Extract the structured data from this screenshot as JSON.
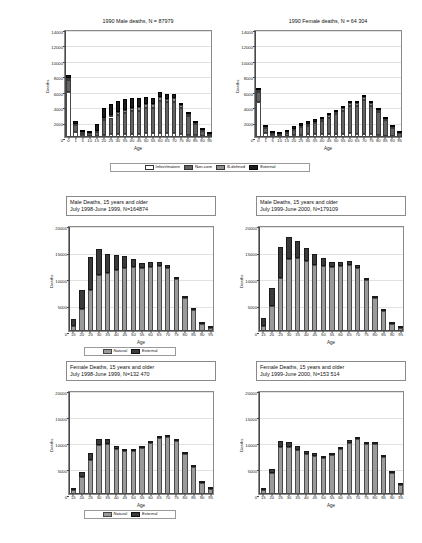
{
  "figure": {
    "background": "#ffffff",
    "axis_color": "#4a4a4a",
    "grid_color": "#e2e2e2"
  },
  "legends": {
    "cause4": {
      "items": [
        {
          "label": "Infect/matern",
          "color": "#ffffff",
          "key": "infect"
        },
        {
          "label": "Non-com",
          "color": "#636363",
          "key": "noncom"
        },
        {
          "label": "Ill-defined",
          "color": "#8f8f8f",
          "key": "illdef"
        },
        {
          "label": "External",
          "color": "#1c1c1c",
          "key": "external"
        }
      ]
    },
    "cause2_a": {
      "items": [
        {
          "label": "Natural",
          "color": "#9a9a9a",
          "key": "natural"
        },
        {
          "label": "External",
          "color": "#3a3a3a",
          "key": "extern2"
        }
      ]
    },
    "cause2_b": {
      "items": [
        {
          "label": "Natural",
          "color": "#9a9a9a",
          "key": "natural"
        },
        {
          "label": "External",
          "color": "#3a3a3a",
          "key": "extern2"
        }
      ]
    }
  },
  "chart_data": [
    {
      "id": "male1990",
      "type": "bar",
      "stacked": true,
      "title": "1990 Male deaths, N = 87979",
      "xlabel": "Age",
      "ylabel": "Deaths",
      "ylim": [
        0,
        14000
      ],
      "yticks": [
        0,
        2000,
        4000,
        6000,
        8000,
        10000,
        12000,
        14000
      ],
      "ytick_labels": [
        "0",
        "2000",
        "4000",
        "6000",
        "8000",
        "10000",
        "12000",
        "14000"
      ],
      "grid": true,
      "categories": [
        "0",
        "1",
        "5",
        "10",
        "15",
        "20",
        "25",
        "30",
        "35",
        "40",
        "45",
        "50",
        "55",
        "60",
        "65",
        "70",
        "75",
        "80",
        "85",
        "90",
        "95"
      ],
      "series": [
        {
          "name": "Infect/matern",
          "key": "infect",
          "values": [
            5900,
            700,
            260,
            180,
            150,
            260,
            330,
            380,
            420,
            420,
            430,
            480,
            500,
            520,
            500,
            480,
            420,
            300,
            200,
            110,
            50
          ]
        },
        {
          "name": "Non-com",
          "key": "noncom",
          "values": [
            1500,
            900,
            280,
            280,
            520,
            1900,
            2200,
            2500,
            2700,
            2900,
            3000,
            3300,
            3300,
            4200,
            4000,
            4100,
            3300,
            2400,
            1500,
            700,
            250
          ]
        },
        {
          "name": "Ill-defined",
          "key": "illdef",
          "values": [
            300,
            120,
            60,
            60,
            120,
            300,
            340,
            370,
            400,
            420,
            430,
            450,
            460,
            480,
            470,
            450,
            380,
            260,
            170,
            80,
            35
          ]
        },
        {
          "name": "External",
          "key": "external",
          "values": [
            400,
            380,
            200,
            280,
            900,
            1300,
            1400,
            1450,
            1450,
            1350,
            1200,
            900,
            800,
            700,
            600,
            500,
            350,
            220,
            140,
            60,
            25
          ]
        }
      ]
    },
    {
      "id": "female1990",
      "type": "bar",
      "stacked": true,
      "title": "1990 Female deaths, N = 64 304",
      "xlabel": "Age",
      "ylabel": "Deaths",
      "ylim": [
        0,
        14000
      ],
      "yticks": [
        0,
        2000,
        4000,
        6000,
        8000,
        10000,
        12000,
        14000
      ],
      "ytick_labels": [
        "0",
        "2000",
        "4000",
        "6000",
        "8000",
        "10000",
        "12000",
        "14000"
      ],
      "grid": true,
      "categories": [
        "0",
        "1",
        "5",
        "10",
        "15",
        "20",
        "25",
        "30",
        "35",
        "40",
        "45",
        "50",
        "55",
        "60",
        "65",
        "70",
        "75",
        "80",
        "85",
        "90",
        "95"
      ],
      "series": [
        {
          "name": "Infect/matern",
          "key": "infect",
          "values": [
            4600,
            520,
            200,
            150,
            160,
            230,
            300,
            340,
            360,
            380,
            400,
            420,
            450,
            470,
            450,
            430,
            360,
            260,
            170,
            90,
            45
          ]
        },
        {
          "name": "Non-com",
          "key": "noncom",
          "values": [
            1200,
            620,
            220,
            210,
            380,
            700,
            950,
            1150,
            1400,
            1700,
            2100,
            2500,
            2900,
            3600,
            3600,
            4400,
            3700,
            3000,
            2000,
            1100,
            480
          ]
        },
        {
          "name": "Ill-defined",
          "key": "illdef",
          "values": [
            260,
            110,
            55,
            50,
            90,
            150,
            190,
            220,
            250,
            280,
            300,
            330,
            360,
            390,
            380,
            380,
            320,
            240,
            160,
            85,
            40
          ]
        },
        {
          "name": "External",
          "key": "external",
          "values": [
            300,
            180,
            120,
            130,
            230,
            330,
            340,
            330,
            310,
            290,
            260,
            230,
            200,
            180,
            160,
            140,
            110,
            80,
            55,
            30,
            15
          ]
        }
      ]
    },
    {
      "id": "male9899",
      "type": "bar",
      "stacked": true,
      "title_lines": [
        "Male Deaths, 15 years and older",
        "July 1998-June 1999, N=164874"
      ],
      "xlabel": "Age",
      "ylabel": "Deaths",
      "ylim": [
        0,
        20000
      ],
      "yticks": [
        0,
        5000,
        10000,
        15000,
        20000
      ],
      "ytick_labels": [
        "0",
        "5000",
        "10000",
        "15000",
        "20000"
      ],
      "grid": true,
      "categories": [
        "15",
        "20",
        "25",
        "30",
        "35",
        "40",
        "45",
        "50",
        "55",
        "60",
        "65",
        "70",
        "75",
        "80",
        "85",
        "90",
        "95"
      ],
      "series": [
        {
          "name": "Natural",
          "key": "natural",
          "values": [
            900,
            4200,
            7700,
            10600,
            11000,
            11500,
            11800,
            12000,
            11800,
            12100,
            12300,
            11900,
            9800,
            6300,
            3900,
            1300,
            500
          ]
        },
        {
          "name": "External",
          "key": "extern2",
          "values": [
            1400,
            3500,
            6300,
            4900,
            3600,
            2800,
            2300,
            1500,
            1000,
            900,
            800,
            600,
            400,
            250,
            150,
            60,
            25
          ]
        }
      ]
    },
    {
      "id": "male9900",
      "type": "bar",
      "stacked": true,
      "title_lines": [
        "Male Deaths, 15 years and older",
        "July 1999-June 2000, N=179109"
      ],
      "xlabel": "Age",
      "ylabel": "Deaths",
      "ylim": [
        0,
        20000
      ],
      "yticks": [
        0,
        5000,
        10000,
        15000,
        20000
      ],
      "ytick_labels": [
        "0",
        "5000",
        "10000",
        "15000",
        "20000"
      ],
      "grid": true,
      "categories": [
        "15",
        "20",
        "25",
        "30",
        "35",
        "40",
        "45",
        "50",
        "55",
        "60",
        "65",
        "70",
        "75",
        "80",
        "85",
        "90",
        "95"
      ],
      "series": [
        {
          "name": "Natural",
          "key": "natural",
          "values": [
            1000,
            4800,
            10000,
            13500,
            13800,
            13200,
            12500,
            12300,
            12000,
            12200,
            12400,
            11800,
            9600,
            6200,
            3800,
            1300,
            500
          ]
        },
        {
          "name": "External",
          "key": "extern2",
          "values": [
            1500,
            3400,
            5800,
            4300,
            3200,
            2500,
            2000,
            1400,
            1000,
            900,
            800,
            600,
            400,
            250,
            150,
            60,
            25
          ]
        }
      ]
    },
    {
      "id": "female9899",
      "type": "bar",
      "stacked": true,
      "title_lines": [
        "Female Deaths, 15 years and older",
        "July 1998-June 1999, N=132 470"
      ],
      "xlabel": "Age",
      "ylabel": "Deaths",
      "ylim": [
        0,
        20000
      ],
      "yticks": [
        0,
        5000,
        10000,
        15000,
        20000
      ],
      "ytick_labels": [
        "0",
        "5000",
        "10000",
        "15000",
        "20000"
      ],
      "grid": true,
      "categories": [
        "15",
        "20",
        "25",
        "30",
        "35",
        "40",
        "45",
        "50",
        "55",
        "60",
        "65",
        "70",
        "75",
        "80",
        "85",
        "90",
        "95"
      ],
      "series": [
        {
          "name": "Natural",
          "key": "natural",
          "values": [
            750,
            3300,
            6600,
            9500,
            9700,
            8700,
            8200,
            8300,
            8800,
            9800,
            10700,
            10900,
            10100,
            7600,
            5200,
            2100,
            900
          ]
        },
        {
          "name": "External",
          "key": "extern2",
          "values": [
            450,
            900,
            1200,
            1000,
            800,
            600,
            500,
            400,
            350,
            350,
            350,
            300,
            250,
            180,
            120,
            50,
            25
          ]
        }
      ]
    },
    {
      "id": "female9900",
      "type": "bar",
      "stacked": true,
      "title_lines": [
        "Female Deaths, 15 years and older",
        "July 1999-June 2000, N=153 514"
      ],
      "xlabel": "Age",
      "ylabel": "Deaths",
      "ylim": [
        0,
        20000
      ],
      "yticks": [
        0,
        5000,
        10000,
        15000,
        20000
      ],
      "ytick_labels": [
        "0",
        "5000",
        "10000",
        "15000",
        "20000"
      ],
      "grid": true,
      "categories": [
        "15",
        "20",
        "25",
        "30",
        "35",
        "40",
        "45",
        "50",
        "55",
        "60",
        "65",
        "70",
        "75",
        "80",
        "85",
        "90",
        "95"
      ],
      "series": [
        {
          "name": "Natural",
          "key": "natural",
          "values": [
            800,
            4000,
            9100,
            9100,
            8400,
            7600,
            7300,
            7000,
            7500,
            8700,
            9900,
            10500,
            9700,
            9600,
            7200,
            4000,
            1800
          ]
        },
        {
          "name": "External",
          "key": "extern2",
          "values": [
            450,
            900,
            1100,
            1000,
            800,
            600,
            500,
            400,
            350,
            350,
            400,
            350,
            300,
            200,
            130,
            60,
            30
          ]
        }
      ]
    }
  ]
}
